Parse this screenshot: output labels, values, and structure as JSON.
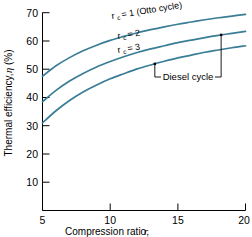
{
  "chart_data": {
    "type": "line",
    "title": "",
    "xlabel": "Compression ratio, r",
    "xlabel_main": "Compression ratio,",
    "xlabel_symbol": "r",
    "ylabel": "Thermal efficiency, η (%)",
    "ylabel_main": "Thermal efficiency,",
    "ylabel_symbol": "η",
    "ylabel_unit": "(%)",
    "xlim": [
      5,
      20
    ],
    "ylim": [
      0,
      70
    ],
    "xticks": [
      5,
      10,
      15,
      20
    ],
    "xtick_labels": [
      "5",
      "10",
      "15",
      "20"
    ],
    "yticks": [
      10,
      20,
      30,
      40,
      50,
      60,
      70
    ],
    "ytick_labels": [
      "10",
      "20",
      "30",
      "40",
      "50",
      "60",
      "70"
    ],
    "grid": false,
    "legend_position": "inline-curve-labels",
    "series_color": "#3A7D96",
    "x": [
      5,
      6,
      7,
      8,
      9,
      10,
      11,
      12,
      13,
      14,
      15,
      16,
      17,
      18,
      19,
      20
    ],
    "series": [
      {
        "name": "r_c = 1 (Otto cycle)",
        "label_prefix": "r",
        "label_subscript": "c",
        "label_suffix": "= 1 (Otto cycle)",
        "values": [
          47.5,
          51.2,
          54.1,
          56.5,
          58.5,
          60.2,
          61.6,
          62.9,
          64.0,
          65.0,
          65.9,
          66.7,
          67.5,
          68.2,
          68.8,
          69.4
        ]
      },
      {
        "name": "r_c = 2",
        "label_prefix": "r",
        "label_subscript": "c",
        "label_suffix": "= 2",
        "values": [
          38.5,
          42.5,
          45.8,
          48.5,
          50.8,
          52.7,
          54.4,
          55.9,
          57.2,
          58.3,
          59.4,
          60.3,
          61.2,
          62.0,
          62.7,
          63.4
        ]
      },
      {
        "name": "r_c = 3",
        "label_prefix": "r",
        "label_subscript": "c",
        "label_suffix": "= 3",
        "values": [
          31.0,
          35.3,
          38.9,
          41.9,
          44.4,
          46.6,
          48.4,
          50.1,
          51.5,
          52.8,
          54.0,
          55.0,
          56.0,
          56.8,
          57.6,
          58.3
        ]
      }
    ],
    "annotations": [
      {
        "text": "Diesel cycle",
        "type": "bracket",
        "from_series": "r_c = 3",
        "to_series": "r_c = 2",
        "x_left": 13.3,
        "x_right": 18.2
      }
    ]
  }
}
